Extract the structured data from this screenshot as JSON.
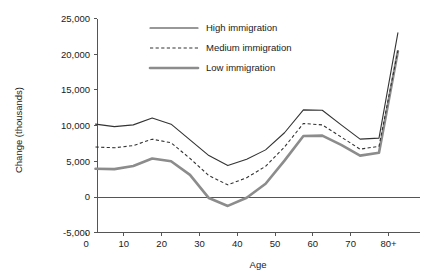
{
  "chart_data": {
    "type": "line",
    "title": "",
    "xlabel": "Age",
    "ylabel": "Change (thousands)",
    "xlim": [
      2.9,
      85.5
    ],
    "ylim": [
      -5000,
      25000
    ],
    "grid": false,
    "legend_position": "top-center",
    "x_tick_labels": [
      "0",
      "10",
      "20",
      "30",
      "40",
      "50",
      "60",
      "70",
      "80+"
    ],
    "x_tick_values": [
      0,
      10,
      20,
      30,
      40,
      50,
      60,
      70,
      80
    ],
    "y_tick_labels": [
      "-5,000",
      "0",
      "5,000",
      "10,000",
      "15,000",
      "20,000",
      "25,000"
    ],
    "y_tick_values": [
      -5000,
      0,
      5000,
      10000,
      15000,
      20000,
      25000
    ],
    "x": [
      2.5,
      7.5,
      12.5,
      17.5,
      22.5,
      27.5,
      32.5,
      37.5,
      42.5,
      47.5,
      52.5,
      57.5,
      62.5,
      67.5,
      72.5,
      77.5,
      82.5
    ],
    "series": [
      {
        "name": "High immigration",
        "style": "solid-thin",
        "color": "#333333",
        "values": [
          10200,
          9850,
          10100,
          11050,
          10200,
          8000,
          5800,
          4400,
          5300,
          6600,
          9000,
          12200,
          12150,
          10100,
          8100,
          8250,
          23000
        ]
      },
      {
        "name": "Medium immigration",
        "style": "dashed",
        "color": "#333333",
        "values": [
          7000,
          6900,
          7200,
          8100,
          7600,
          5400,
          3000,
          1700,
          2700,
          4300,
          7000,
          10300,
          10100,
          8400,
          6700,
          7100,
          20500
        ]
      },
      {
        "name": "Low immigration",
        "style": "solid-thick",
        "color": "#8c8c8c",
        "values": [
          3950,
          3900,
          4350,
          5400,
          5000,
          3100,
          -150,
          -1250,
          -100,
          1850,
          5100,
          8550,
          8600,
          7300,
          5800,
          6200,
          20400
        ]
      }
    ]
  },
  "legend": {
    "items": [
      {
        "label": "High immigration"
      },
      {
        "label": "Medium immigration"
      },
      {
        "label": "Low immigration"
      }
    ]
  },
  "axes": {
    "x_title": "Age",
    "y_title": "Change (thousands)"
  },
  "colors": {
    "axis": "#555555",
    "high": "#333333",
    "medium": "#333333",
    "low": "#8c8c8c",
    "background": "#ffffff"
  }
}
